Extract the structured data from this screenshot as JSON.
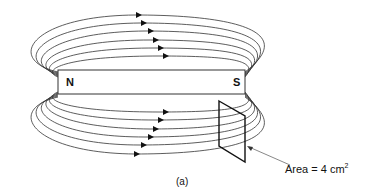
{
  "figure": {
    "caption": "(a)",
    "magnet": {
      "north_label": "N",
      "south_label": "S"
    },
    "surface": {
      "label": "Area = 4 cm",
      "superscript": "2"
    },
    "field_lines": {
      "above_count": 6,
      "below_count": 6,
      "direction": "left-to-right (N to S outside magnet)",
      "color": "#222222"
    }
  }
}
